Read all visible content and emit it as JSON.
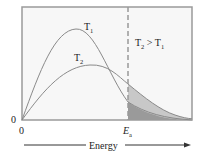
{
  "diagram": {
    "type": "maxwell-boltzmann-distribution",
    "curves": [
      {
        "name": "T1",
        "label_main": "T",
        "label_sub": "1",
        "color": "#8a8a8a",
        "peak": "higher, narrower"
      },
      {
        "name": "T2",
        "label_main": "T",
        "label_sub": "2",
        "color": "#8a8a8a",
        "peak": "lower, broader"
      }
    ],
    "threshold": {
      "label_main": "E",
      "label_sub": "a",
      "style": "dashed",
      "color": "#999999"
    },
    "annotation": {
      "left_main": "T",
      "left_sub": "2",
      "op": " > ",
      "right_main": "T",
      "right_sub": "1"
    },
    "axes": {
      "y_origin_label": "0",
      "x_origin_label": "0",
      "x_axis_label": "Energy"
    },
    "shading": {
      "t2_tail_color": "#c8c8c8",
      "t1_tail_color": "#9a9a9a"
    },
    "colors": {
      "frame": "#9a9a9a",
      "plot_bg": "#f7f7f7"
    }
  }
}
